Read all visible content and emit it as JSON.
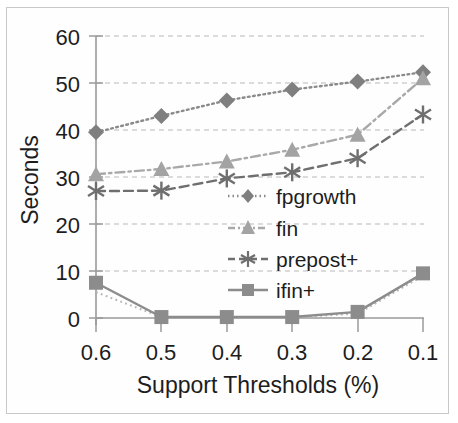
{
  "chart_data": {
    "type": "line",
    "title": "",
    "xlabel": "Support Thresholds (%)",
    "ylabel": "Seconds",
    "categories": [
      "0.6",
      "0.5",
      "0.4",
      "0.3",
      "0.2",
      "0.1"
    ],
    "xtick_labels": [
      "0.6",
      "0.5",
      "0.4",
      "0.3",
      "0.2",
      "0.1"
    ],
    "ytick_labels": [
      "0",
      "10",
      "20",
      "30",
      "40",
      "50",
      "60"
    ],
    "ytick_values": [
      0,
      10,
      20,
      30,
      40,
      50,
      60
    ],
    "ylim": [
      0,
      60
    ],
    "grid": "horizontal-dashed",
    "legend_position": "inside-center-right",
    "series": [
      {
        "name": "fpgrowth",
        "marker": "diamond",
        "linestyle": "dotted",
        "color": "#8a8a8a",
        "values": [
          39.5,
          43.0,
          46.3,
          48.6,
          50.3,
          52.3
        ]
      },
      {
        "name": "fin",
        "marker": "triangle",
        "linestyle": "dash-dot",
        "color": "#a9a9a9",
        "values": [
          30.6,
          31.7,
          33.3,
          35.8,
          39.0,
          51.0
        ]
      },
      {
        "name": "prepost+",
        "marker": "asterisk",
        "linestyle": "dashed",
        "color": "#6f6f6f",
        "values": [
          27.0,
          27.1,
          29.7,
          31.0,
          34.0,
          43.3
        ]
      },
      {
        "name": "ifin+",
        "marker": "square",
        "linestyle": "solid",
        "color": "#8c8c8c",
        "values": [
          7.5,
          0.2,
          0.2,
          0.2,
          1.3,
          9.5
        ]
      }
    ],
    "extra_traces": [
      {
        "name": "ifin+-shadow",
        "linestyle": "dotted",
        "color": "#b5b5b5",
        "values": [
          5.5,
          0.2,
          0.2,
          0.2,
          0.9,
          9.0
        ]
      }
    ]
  },
  "legend": {
    "items": [
      {
        "label": "fpgrowth"
      },
      {
        "label": "fin"
      },
      {
        "label": "prepost+"
      },
      {
        "label": "ifin+"
      }
    ]
  },
  "colors": {
    "frame": "#c9c9c9",
    "axis": "#9a9a9a",
    "grid": "#b8b8b8",
    "text": "#1d1d1d",
    "background": "#ffffff"
  }
}
